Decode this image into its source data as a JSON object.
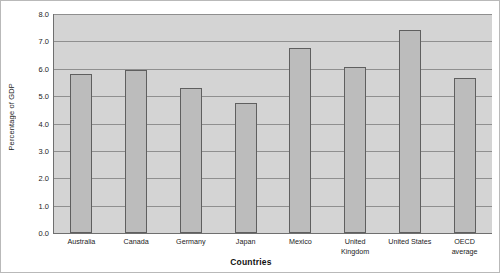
{
  "chart_data": {
    "type": "bar",
    "title": "",
    "subtitle": "",
    "xlabel": "Countries",
    "ylabel": "Percentage of GDP",
    "categories": [
      "Australia",
      "Canada",
      "Germany",
      "Japan",
      "Mexico",
      "United Kingdom",
      "United States",
      "OECD average"
    ],
    "category_label_lines": [
      "Australia",
      "Canada",
      "Germany",
      "Japan",
      "Mexico",
      "United\nKingdom",
      "United States",
      "OECD\naverage"
    ],
    "values": [
      5.8,
      5.95,
      5.3,
      4.75,
      6.75,
      6.05,
      7.4,
      5.65
    ],
    "ylim": [
      0.0,
      8.0
    ],
    "ytick_step": 1.0,
    "ytick_labels": [
      "8.0",
      "7.0",
      "6.0",
      "5.0",
      "4.0",
      "3.0",
      "2.0",
      "1.0",
      "0.0"
    ],
    "ytick_values": [
      8.0,
      7.0,
      6.0,
      5.0,
      4.0,
      3.0,
      2.0,
      1.0,
      0.0
    ],
    "grid": true,
    "grid_axis": "y",
    "legend": false,
    "legend_position": "none",
    "colors": {
      "bar_fill": "#bcbcbc",
      "bar_border": "#5f5f5f",
      "plot_background": "#d4d4d4",
      "gridline": "#8f8f8f",
      "axis_line": "#6f6f6f",
      "chart_border": "#b9b9b9",
      "text": "#1c1c1c",
      "page_background": "#ffffff"
    }
  }
}
